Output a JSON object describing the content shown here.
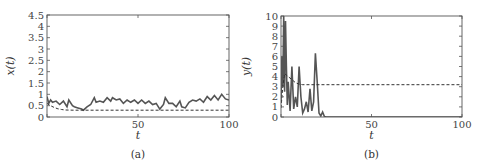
{
  "chart_data": [
    {
      "id": "a",
      "type": "line",
      "caption": "(a)",
      "xlabel": "t",
      "ylabel": "x(t)",
      "xlim": [
        0,
        100
      ],
      "ylim": [
        0,
        4.5
      ],
      "xticks": [
        0,
        50,
        100
      ],
      "xtick_labels": [
        "",
        "50",
        "100"
      ],
      "yticks": [
        0,
        0.5,
        1,
        1.5,
        2,
        2.5,
        3,
        3.5,
        4,
        4.5
      ],
      "ytick_labels": [
        "0",
        "0.5",
        "1",
        "1.5",
        "2",
        "2.5",
        "3",
        "3.5",
        "4",
        "4.5"
      ],
      "grid": false,
      "series": [
        {
          "name": "stochastic x(t)",
          "style": "solid",
          "color": "#555555",
          "x": [
            0,
            1,
            2,
            3,
            5,
            7,
            9,
            11,
            12,
            14,
            15,
            17,
            19,
            20,
            22,
            24,
            26,
            27,
            29,
            31,
            33,
            35,
            36,
            38,
            40,
            42,
            44,
            46,
            48,
            50,
            52,
            54,
            56,
            58,
            60,
            62,
            64,
            65,
            67,
            69,
            71,
            73,
            74,
            76,
            78,
            80,
            82,
            84,
            86,
            88,
            90,
            92,
            94,
            96,
            98,
            100
          ],
          "y": [
            0.9,
            0.6,
            0.75,
            0.65,
            0.7,
            0.55,
            0.7,
            0.45,
            0.75,
            0.5,
            0.45,
            0.4,
            0.35,
            0.3,
            0.45,
            0.55,
            0.85,
            0.65,
            0.7,
            0.65,
            0.85,
            0.7,
            0.85,
            0.75,
            0.8,
            0.6,
            0.75,
            0.65,
            0.75,
            0.6,
            0.75,
            0.6,
            0.7,
            0.55,
            0.6,
            0.35,
            0.55,
            0.85,
            0.6,
            0.6,
            0.45,
            0.7,
            0.45,
            0.4,
            0.65,
            0.75,
            0.7,
            0.8,
            0.65,
            0.9,
            0.75,
            0.95,
            0.75,
            1.0,
            0.8,
            0.75
          ]
        },
        {
          "name": "deterministic x(t)",
          "style": "dashed",
          "color": "#333333",
          "x": [
            0,
            2,
            4,
            6,
            8,
            10,
            15,
            20,
            100
          ],
          "y": [
            0.6,
            0.5,
            0.42,
            0.36,
            0.33,
            0.31,
            0.3,
            0.3,
            0.3
          ]
        }
      ]
    },
    {
      "id": "b",
      "type": "line",
      "caption": "(b)",
      "xlabel": "t",
      "ylabel": "y(t)",
      "xlim": [
        0,
        100
      ],
      "ylim": [
        0,
        10
      ],
      "xticks": [
        0,
        50,
        100
      ],
      "xtick_labels": [
        "",
        "50",
        "100"
      ],
      "yticks": [
        0,
        1,
        2,
        3,
        4,
        5,
        6,
        7,
        8,
        9,
        10
      ],
      "ytick_labels": [
        "0",
        "1",
        "2",
        "3",
        "4",
        "5",
        "6",
        "7",
        "8",
        "9",
        "10"
      ],
      "grid": false,
      "series": [
        {
          "name": "stochastic y(t)",
          "style": "solid",
          "color": "#555555",
          "x": [
            0,
            0.5,
            1,
            1.5,
            2,
            2.5,
            3,
            3.5,
            4,
            5,
            6,
            7,
            8,
            9,
            10,
            11,
            12,
            13,
            14,
            15,
            16,
            17,
            18,
            19,
            20,
            21,
            22,
            23,
            24,
            25,
            100
          ],
          "y": [
            1.5,
            6.0,
            3.0,
            10.0,
            2.5,
            9.5,
            5.0,
            1.2,
            3.5,
            0.6,
            5.0,
            0.8,
            2.0,
            1.0,
            5.0,
            2.0,
            0.4,
            0.8,
            1.5,
            0.5,
            2.8,
            0.6,
            1.5,
            6.3,
            3.5,
            0.4,
            0.1,
            0.5,
            0.05,
            0.0,
            0.0
          ]
        },
        {
          "name": "deterministic y(t)",
          "style": "dashed",
          "color": "#333333",
          "x": [
            0,
            1,
            2,
            4,
            6,
            8,
            10,
            12,
            100
          ],
          "y": [
            0.9,
            3.0,
            4.3,
            4.0,
            3.7,
            3.4,
            3.25,
            3.2,
            3.2
          ]
        }
      ]
    }
  ]
}
